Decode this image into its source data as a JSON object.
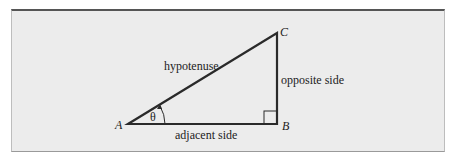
{
  "diagram": {
    "vertices": {
      "a": "A",
      "b": "B",
      "c": "C"
    },
    "sides": {
      "hypotenuse": "hypotenuse",
      "opposite": "opposite side",
      "adjacent": "adjacent side"
    },
    "angle": "θ",
    "colors": {
      "background": "#ececec",
      "stroke": "#2a2a2a"
    }
  }
}
